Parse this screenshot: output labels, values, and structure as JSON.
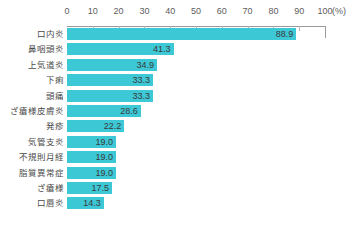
{
  "chart_data": {
    "type": "bar",
    "orientation": "horizontal",
    "title": "",
    "subtitle": "",
    "xlabel": "(%)",
    "ylabel": "",
    "xlim": [
      0,
      100
    ],
    "xticks": [
      0,
      10,
      20,
      30,
      40,
      50,
      60,
      70,
      80,
      90,
      100
    ],
    "xtick_labels": [
      "0",
      "10",
      "20",
      "30",
      "40",
      "50",
      "60",
      "70",
      "80",
      "90",
      "100"
    ],
    "unit_label": "(%)",
    "grid": true,
    "legend": false,
    "categories": [
      "口内炎",
      "鼻咽頭炎",
      "上気道炎",
      "下痢",
      "頭痛",
      "ざ瘡様皮膚炎",
      "発疹",
      "気管支炎",
      "不規則月経",
      "脂質異常症",
      "ざ瘡様",
      "口唇炎"
    ],
    "values": [
      88.9,
      41.3,
      34.9,
      33.3,
      33.3,
      28.6,
      22.2,
      19.0,
      19.0,
      19.0,
      17.5,
      14.3
    ],
    "value_labels": [
      "88.9",
      "41.3",
      "34.9",
      "33.3",
      "33.3",
      "28.6",
      "22.2",
      "19.0",
      "19.0",
      "19.0",
      "17.5",
      "14.3"
    ],
    "bar_color": "#3dc8d6",
    "axis_color": "#9a9a9a",
    "grid_color": "#b4b4b4",
    "text_color": "#4a4a4a"
  }
}
